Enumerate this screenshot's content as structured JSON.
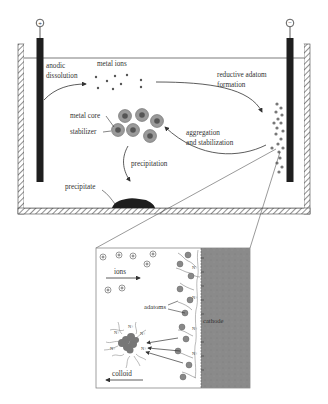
{
  "diagram": {
    "colors": {
      "electrode": "#1e1e1e",
      "cathode_fill": "#8a8a8a",
      "particle": "#8c8c8c",
      "line": "#333333",
      "hatch": "#444444"
    },
    "terminals": {
      "anode_symbol": "+",
      "cathode_symbol": "−"
    },
    "cell_labels": {
      "anodic_line1": "anodic",
      "anodic_line2": "dissolution",
      "metal_ions": "metal ions",
      "reductive_line1": "reductive adatom",
      "reductive_line2": "formation",
      "metal_core": "metal core",
      "stabilizer": "stabilizer",
      "aggregation_line1": "aggregation",
      "aggregation_line2": "and stabilization",
      "precipitation": "precipitation",
      "precipitate": "precipitate"
    },
    "inset_labels": {
      "ions": "ions",
      "adatoms": "adatoms",
      "cathode": "cathode",
      "colloid": "colloid",
      "ammonium": "N+",
      "ion_symbol": "+"
    }
  }
}
